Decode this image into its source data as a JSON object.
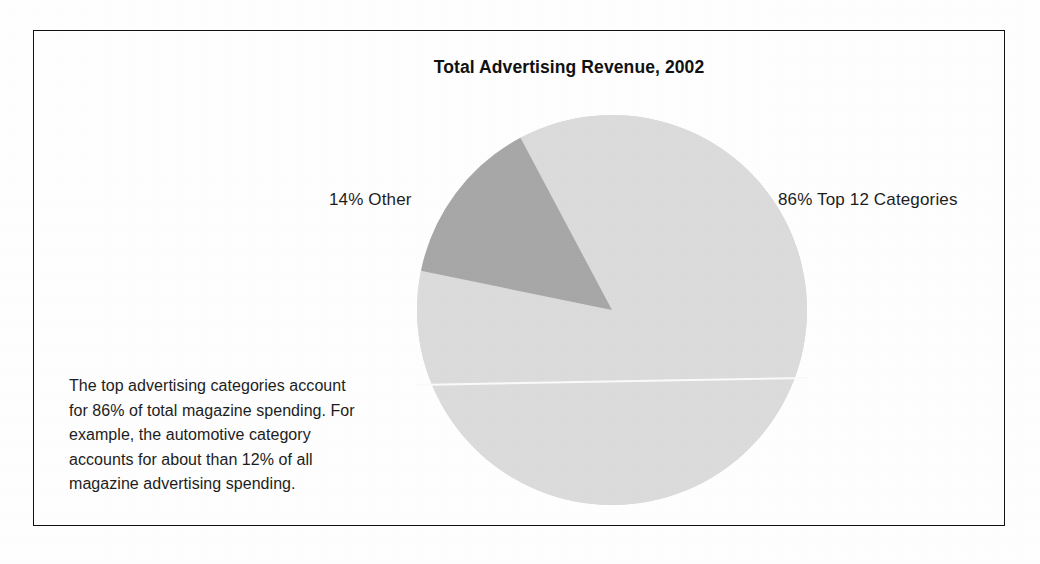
{
  "figure": {
    "title": "Total Advertising Revenue, 2002",
    "caption": "The top advertising categories account for 86% of total magazine spending. For example, the automotive category accounts for about than 12% of all magazine advertising spending.",
    "border_color": "#111111",
    "background_color": "#ffffff"
  },
  "labels": {
    "other": "14% Other",
    "top12": "86% Top 12 Categories"
  },
  "chart_data": {
    "type": "pie",
    "title": "Total Advertising Revenue, 2002",
    "xlabel": "",
    "ylabel": "",
    "grid": false,
    "legend_position": "none",
    "unit": "percent",
    "total": 100,
    "start_angle_deg": -28,
    "direction": "clockwise",
    "slices": [
      {
        "label": "Top 12 Categories",
        "display_label": "86% Top 12 Categories",
        "value": 86,
        "color": "#dcdcdc",
        "label_side": "right"
      },
      {
        "label": "Other",
        "display_label": "14% Other",
        "value": 14,
        "color": "#a8a8a8",
        "label_side": "left"
      }
    ],
    "annotations": [
      "The top advertising categories account for 86% of total magazine spending.",
      "For example, the automotive category accounts for about than 12% of all magazine advertising spending."
    ]
  },
  "geometry": {
    "center_x": 578,
    "center_y": 279,
    "radius": 195
  }
}
